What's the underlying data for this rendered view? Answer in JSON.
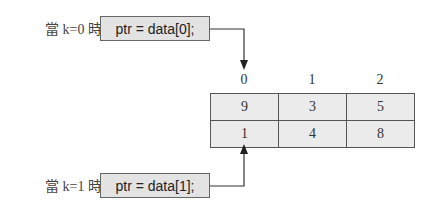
{
  "row0": {
    "label": "當 k=0 時，",
    "code": "ptr = data[0];"
  },
  "row1": {
    "label": "當 k=1 時，",
    "code": "ptr = data[1];"
  },
  "indices": [
    "0",
    "1",
    "2"
  ],
  "array": [
    [
      "9",
      "3",
      "5"
    ],
    [
      "1",
      "4",
      "8"
    ]
  ]
}
